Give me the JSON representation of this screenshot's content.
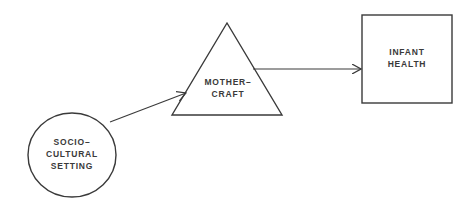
{
  "diagram": {
    "type": "causal-flow",
    "nodes": [
      {
        "id": "socio-cultural-setting",
        "shape": "circle",
        "lines": [
          "SOCIO–",
          "CULTURAL",
          "SETTING"
        ]
      },
      {
        "id": "mothercraft",
        "shape": "triangle",
        "lines": [
          "MOTHER–",
          "CRAFT"
        ]
      },
      {
        "id": "infant-health",
        "shape": "square",
        "lines": [
          "INFANT",
          "HEALTH"
        ]
      }
    ],
    "edges": [
      {
        "from": "socio-cultural-setting",
        "to": "mothercraft"
      },
      {
        "from": "mothercraft",
        "to": "infant-health"
      }
    ],
    "colors": {
      "stroke": "#3a3a3a",
      "background": "#ffffff"
    }
  }
}
